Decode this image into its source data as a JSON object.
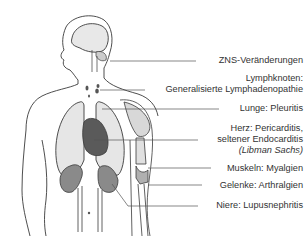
{
  "diagram": {
    "title": "",
    "colors": {
      "outline": "#3a3a3a",
      "lung_fill": "#e6e6e6",
      "heart_fill": "#5a5a5a",
      "kidney_fill": "#8a8a8a",
      "brain_fill": "#e8e8e8",
      "muscle_fill": "#d8d8d8",
      "text": "#333333",
      "leader_line": "#555555"
    },
    "labels": [
      {
        "id": "zns",
        "text": "ZNS-Veränderungen"
      },
      {
        "id": "lymph_line1",
        "text": "Lymphknoten:"
      },
      {
        "id": "lymph_line2",
        "text": "Generalisierte Lymphadenopathie"
      },
      {
        "id": "lunge",
        "text": "Lunge: Pleuritis"
      },
      {
        "id": "herz_line1",
        "text": "Herz: Pericarditis,"
      },
      {
        "id": "herz_line2",
        "text": "seltener Endocarditis"
      },
      {
        "id": "herz_line3",
        "text": "(Libman Sachs)"
      },
      {
        "id": "muskeln",
        "text": "Muskeln: Myalgien"
      },
      {
        "id": "gelenke",
        "text": "Gelenke: Arthralgien"
      },
      {
        "id": "niere",
        "text": "Niere: Lupusnephritis"
      }
    ]
  }
}
